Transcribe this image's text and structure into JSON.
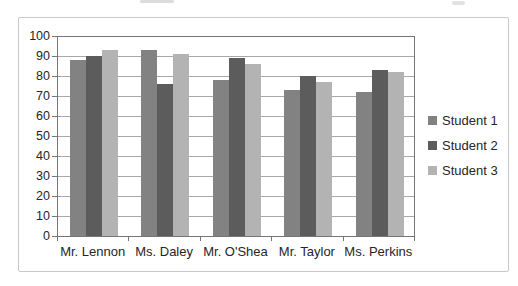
{
  "chart_data": {
    "type": "bar",
    "categories": [
      "Mr. Lennon",
      "Ms. Daley",
      "Mr. O'Shea",
      "Mr. Taylor",
      "Ms. Perkins"
    ],
    "series": [
      {
        "name": "Student 1",
        "color": "#828282",
        "values": [
          88,
          93,
          78,
          73,
          72
        ]
      },
      {
        "name": "Student 2",
        "color": "#5c5c5c",
        "values": [
          90,
          76,
          89,
          80,
          83
        ]
      },
      {
        "name": "Student 3",
        "color": "#b3b3b3",
        "values": [
          93,
          91,
          86,
          77,
          82
        ]
      }
    ],
    "title": "",
    "xlabel": "",
    "ylabel": "",
    "ylim": [
      0,
      100
    ],
    "yticks": [
      0,
      10,
      20,
      30,
      40,
      50,
      60,
      70,
      80,
      90,
      100
    ],
    "grid": true,
    "legend_position": "right"
  },
  "palette": {
    "gridline": "#a8a8a8",
    "axis": "#757575",
    "text": "#262626",
    "frame_border": "#c9c9c9",
    "background": "#ffffff"
  }
}
